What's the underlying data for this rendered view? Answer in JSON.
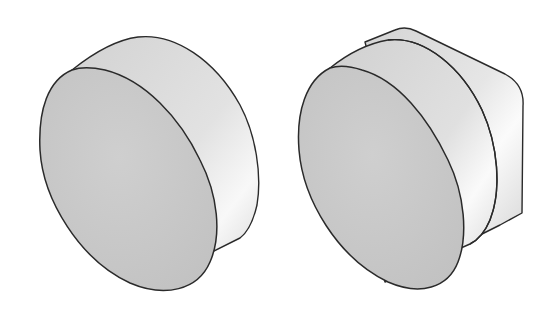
{
  "figure": {
    "background_color": "#ffffff",
    "outline_color": "#2a2a2a",
    "face_color": "#c8c8c8",
    "side_color": "#dcdcdc",
    "highlight_color": "#f6f6f6",
    "shapes": [
      {
        "id": "left",
        "label": "cylinder",
        "parts": [
          "front-circular-face",
          "cylindrical-side"
        ]
      },
      {
        "id": "right",
        "label": "cylinder-with-rounded-square-extension",
        "parts": [
          "front-circular-face",
          "cylindrical-band",
          "rounded-square-back-extension"
        ]
      }
    ]
  }
}
